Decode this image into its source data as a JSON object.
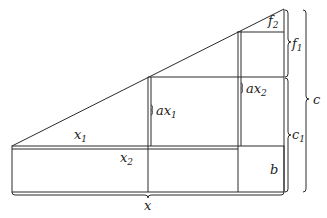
{
  "diagram": {
    "type": "geometric-construction",
    "labels": {
      "x1": {
        "base": "x",
        "sub": "1"
      },
      "x2": {
        "base": "x",
        "sub": "2"
      },
      "x": {
        "base": "x",
        "sub": ""
      },
      "ax1": {
        "base": "ax",
        "sub": "1"
      },
      "ax2": {
        "base": "ax",
        "sub": "2"
      },
      "f1": {
        "base": "f",
        "sub": "1"
      },
      "f2": {
        "base": "f",
        "sub": "2"
      },
      "c1": {
        "base": "c",
        "sub": "1"
      },
      "c": {
        "base": "c",
        "sub": ""
      },
      "b": {
        "base": "b",
        "sub": ""
      }
    }
  }
}
